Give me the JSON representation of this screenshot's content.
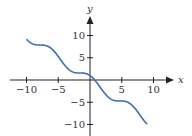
{
  "chart_data": {
    "type": "line",
    "title": "",
    "function": "y = cos(x) - x",
    "xlabel": "x",
    "ylabel": "y",
    "xlim": [
      -10,
      9
    ],
    "x_ticks": [
      -10,
      -5,
      5,
      10
    ],
    "x_tick_labels": [
      "−10",
      "−5",
      "5",
      "10"
    ],
    "y_ticks": [
      10,
      5,
      -5,
      -10
    ],
    "y_tick_labels": [
      "10",
      "5",
      "−5",
      "−10"
    ],
    "grid": false,
    "legend": null,
    "series": [
      {
        "name": "curve",
        "color": "#3a6fb5",
        "x": [
          -10,
          -9,
          -8,
          -7,
          -6,
          -5,
          -4,
          -3,
          -2,
          -1,
          0,
          1,
          2,
          3,
          4,
          5,
          6,
          7,
          8,
          9
        ],
        "values": [
          9.16,
          8.09,
          7.85,
          7.75,
          6.96,
          5.28,
          3.35,
          2.01,
          1.58,
          1.54,
          1.0,
          -0.46,
          -2.42,
          -3.99,
          -4.65,
          -4.72,
          -5.04,
          -6.25,
          -8.15,
          -9.91
        ]
      }
    ]
  },
  "colors": {
    "axis": "#222222",
    "curve": "#3a6fb5",
    "text": "#333333"
  }
}
